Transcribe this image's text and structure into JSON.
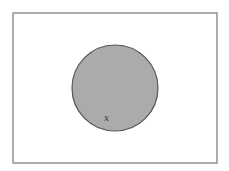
{
  "diagram": {
    "type": "venn",
    "universal_set": {
      "x": 13,
      "y": 13,
      "width": 204,
      "height": 150,
      "stroke": "#777777",
      "fill": "#ffffff"
    },
    "sets": [
      {
        "cx": 115,
        "cy": 88,
        "r": 43,
        "fill": "#ababab",
        "stroke": "#555555",
        "shaded": true
      }
    ],
    "labels": [
      {
        "text": "x",
        "x": 104,
        "y": 121
      }
    ]
  }
}
